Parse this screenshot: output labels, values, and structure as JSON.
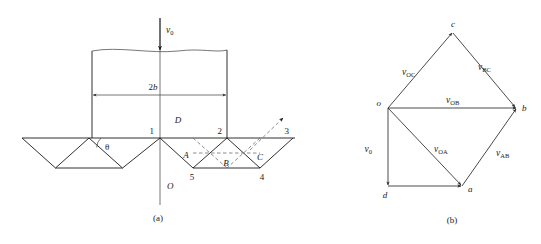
{
  "figure": {
    "title": "",
    "panels": [
      {
        "id": "a",
        "caption": "(a)"
      },
      {
        "id": "b",
        "caption": "(b)"
      }
    ]
  },
  "colors": {
    "line": "#1a1a1a",
    "thin": "#4a4a4a",
    "dashed": "#6e6e6e",
    "background": "#ffffff"
  },
  "panel_a": {
    "caption": "(a)",
    "velocity_label": "v",
    "velocity_sub": "0",
    "dimension_label": "2b",
    "angle_label": "θ",
    "origin_label": "O",
    "nodes": [
      {
        "name": "node-1",
        "label": "1"
      },
      {
        "name": "node-2",
        "label": "2"
      },
      {
        "name": "node-3",
        "label": "3"
      },
      {
        "name": "node-4",
        "label": "4"
      },
      {
        "name": "node-5",
        "label": "5"
      }
    ],
    "regions": [
      {
        "name": "region-A",
        "label": "A"
      },
      {
        "name": "region-B",
        "label": "B"
      },
      {
        "name": "region-C",
        "label": "C"
      },
      {
        "name": "region-D",
        "label": "D"
      }
    ]
  },
  "panel_b": {
    "caption": "(b)",
    "poles": [
      {
        "name": "pole-o",
        "label": "o"
      },
      {
        "name": "pole-a",
        "label": "a"
      },
      {
        "name": "pole-b",
        "label": "b"
      },
      {
        "name": "pole-c",
        "label": "c"
      },
      {
        "name": "pole-d",
        "label": "d"
      }
    ],
    "vectors": [
      {
        "name": "vector-v0",
        "symbol": "v",
        "sub": "0",
        "from": "o",
        "to": "d"
      },
      {
        "name": "vector-vOC",
        "symbol": "v",
        "sub": "OC",
        "from": "o",
        "to": "c"
      },
      {
        "name": "vector-vBC",
        "symbol": "v",
        "sub": "BC",
        "from": "c",
        "to": "b"
      },
      {
        "name": "vector-vOB",
        "symbol": "v",
        "sub": "OB",
        "from": "o",
        "to": "b"
      },
      {
        "name": "vector-vOA",
        "symbol": "v",
        "sub": "OA",
        "from": "o",
        "to": "a"
      },
      {
        "name": "vector-vAB",
        "symbol": "v",
        "sub": "AB",
        "from": "a",
        "to": "b"
      },
      {
        "name": "vector-da",
        "symbol": "",
        "sub": "",
        "from": "d",
        "to": "a"
      }
    ]
  }
}
